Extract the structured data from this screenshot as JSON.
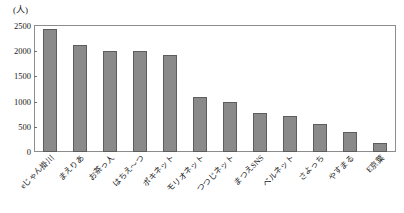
{
  "chart_data": {
    "type": "bar",
    "title": "",
    "subtitle": "",
    "xlabel": "",
    "ylabel": "(人)",
    "ylim": [
      0,
      2500
    ],
    "ytick_values": [
      0,
      500,
      1000,
      1500,
      2000,
      2500
    ],
    "ytick_labels": [
      "0",
      "500",
      "1000",
      "1500",
      "2000",
      "2500"
    ],
    "grid": false,
    "legend": false,
    "legend_position": "none",
    "bar_color": "#8a8a8a",
    "bar_edge_color": "#5d5d5d",
    "axis_color": "#8d8d8d",
    "categories": [
      "eじゃん掛川",
      "まえりあ",
      "お茶っ人",
      "はちえ〜つ",
      "ポキネット",
      "モリオネット",
      "つつじネット",
      "まつえSNS",
      "ベルネット",
      "さよっち",
      "やすまる",
      "E京葉"
    ],
    "values": [
      2450,
      2120,
      2000,
      2000,
      1930,
      1100,
      1000,
      770,
      720,
      550,
      400,
      170
    ]
  },
  "axis": {
    "unit_caption": "(人)"
  }
}
